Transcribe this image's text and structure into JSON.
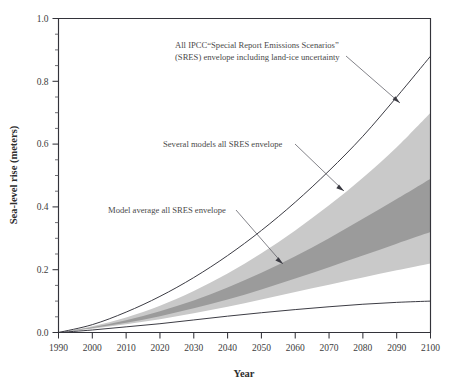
{
  "chart_data": {
    "type": "area",
    "title": "",
    "xlabel": "Year",
    "ylabel": "Sea-level rise (meters)",
    "xlim": [
      1990,
      2100
    ],
    "ylim": [
      0.0,
      1.0
    ],
    "grid": false,
    "legend_position": "annotations-with-leader-lines",
    "x": [
      1990,
      2000,
      2010,
      2020,
      2030,
      2040,
      2050,
      2060,
      2070,
      2080,
      2090,
      2100
    ],
    "x_tick_labels": [
      "1990",
      "2000",
      "2010",
      "2020",
      "2030",
      "2040",
      "2050",
      "2060",
      "2070",
      "2080",
      "2090",
      "2100"
    ],
    "y_tick_labels": [
      "0.0",
      "0.2",
      "0.4",
      "0.6",
      "0.8",
      "1.0"
    ],
    "y_major_ticks": [
      0.0,
      0.2,
      0.4,
      0.6,
      0.8,
      1.0
    ],
    "y_minor_tick_step": 0.05,
    "series": [
      {
        "name": "All IPCC SRES envelope including land-ice uncertainty (upper bound)",
        "role": "outer-upper-curve",
        "style": "line",
        "values": [
          0.0,
          0.025,
          0.065,
          0.115,
          0.175,
          0.245,
          0.325,
          0.415,
          0.515,
          0.625,
          0.75,
          0.88
        ]
      },
      {
        "name": "All IPCC SRES envelope including land-ice uncertainty (lower bound)",
        "role": "outer-lower-curve",
        "style": "line",
        "values": [
          0.0,
          0.008,
          0.018,
          0.028,
          0.04,
          0.052,
          0.063,
          0.073,
          0.082,
          0.09,
          0.096,
          0.1
        ]
      },
      {
        "name": "Several models all SRES envelope (upper bound)",
        "role": "light-band-upper",
        "style": "shaded-light",
        "values": [
          0.0,
          0.02,
          0.048,
          0.085,
          0.132,
          0.188,
          0.252,
          0.325,
          0.405,
          0.493,
          0.59,
          0.7
        ]
      },
      {
        "name": "Several models all SRES envelope (lower bound)",
        "role": "light-band-lower",
        "style": "shaded-light",
        "values": [
          0.0,
          0.012,
          0.026,
          0.042,
          0.061,
          0.082,
          0.105,
          0.129,
          0.152,
          0.175,
          0.198,
          0.22
        ]
      },
      {
        "name": "Model average all SRES envelope (upper bound)",
        "role": "dark-band-upper",
        "style": "shaded-dark",
        "values": [
          0.0,
          0.017,
          0.039,
          0.068,
          0.102,
          0.143,
          0.19,
          0.243,
          0.3,
          0.362,
          0.425,
          0.49
        ]
      },
      {
        "name": "Model average all SRES envelope (lower bound)",
        "role": "dark-band-lower",
        "style": "shaded-dark",
        "values": [
          0.0,
          0.014,
          0.031,
          0.052,
          0.077,
          0.105,
          0.137,
          0.172,
          0.208,
          0.245,
          0.283,
          0.32
        ]
      }
    ],
    "annotations": [
      {
        "id": "outer-envelope",
        "line1": "All IPCC“Special Report Emissions Scenarios”",
        "line2": "(SRES) envelope including land-ice uncertainty"
      },
      {
        "id": "several-models",
        "line1": "Several models all SRES envelope"
      },
      {
        "id": "model-average",
        "line1": "Model average all SRES envelope"
      }
    ],
    "colors": {
      "light_band": "#c9c9c9",
      "dark_band": "#9b9b9b",
      "axis": "#33333a",
      "curve": "#3c3c44",
      "text": "#4a4a4a",
      "background": "#ffffff"
    }
  }
}
